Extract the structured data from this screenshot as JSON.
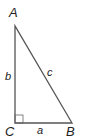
{
  "diagram": {
    "vertices": {
      "A": "A",
      "B": "B",
      "C": "C"
    },
    "sides": {
      "a": "a",
      "b": "b",
      "c": "c"
    },
    "right_angle_at": "C",
    "colors": {
      "line": "#555555",
      "text": "#222222"
    }
  }
}
